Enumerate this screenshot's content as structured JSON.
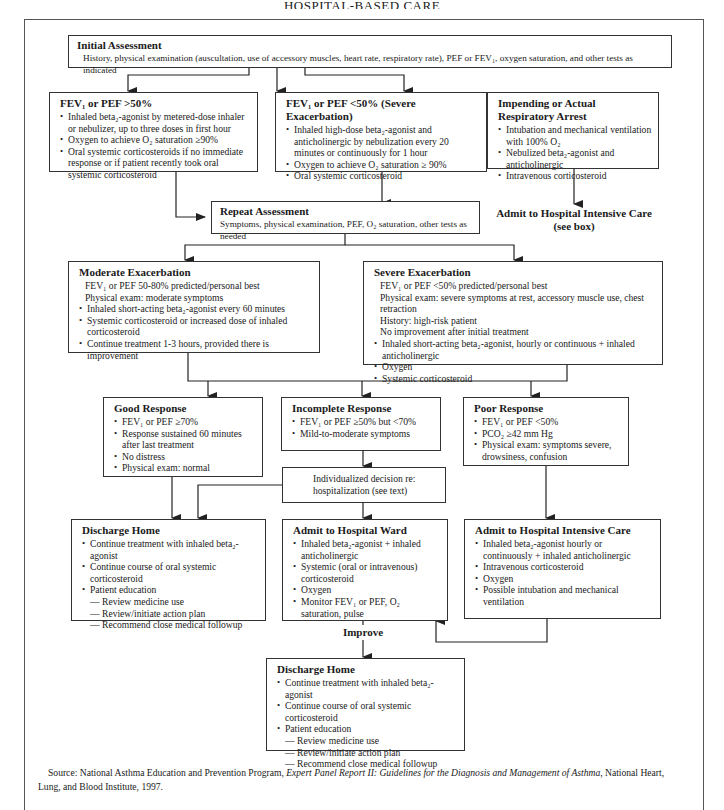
{
  "page": {
    "title": "HOSPITAL-BASED CARE"
  },
  "initial_assessment": {
    "title": "Initial Assessment",
    "text": "History, physical examination (auscultation, use of accessory muscles, heart rate, respiratory rate), PEF or FEV₁, oxygen saturation, and other tests as indicated"
  },
  "fev_above_50": {
    "title": "FEV₁ or PEF >50%",
    "items": [
      "Inhaled beta₂-agonist by metered-dose inhaler or nebulizer, up to three doses in first hour",
      "Oxygen to achieve O₂ saturation ≥90%",
      "Oral systemic corticosteroids if no immediate response or if patient recently took oral systemic corticosteroid"
    ]
  },
  "fev_below_50": {
    "title": "FEV₁ or PEF <50% (Severe Exacerbation)",
    "items": [
      "Inhaled high-dose beta₂-agonist and anticholinergic by nebulization every 20 minutes or continuously for 1 hour",
      "Oxygen to achieve O₂ saturation ≥ 90%",
      "Oral systemic corticosteroid"
    ]
  },
  "respiratory_arrest": {
    "title": "Impending or Actual Respiratory Arrest",
    "items": [
      "Intubation and mechanical ventilation with 100% O₂",
      "Nebulized beta₂-agonist and anticholinergic",
      "Intravenous corticosteroid"
    ]
  },
  "admit_icu_label": {
    "line1": "Admit to Hospital Intensive Care",
    "line2": "(see box)"
  },
  "repeat_assessment": {
    "title": "Repeat Assessment",
    "text": "Symptoms, physical examination, PEF, O₂ saturation, other tests as needed"
  },
  "moderate_exacerbation": {
    "title": "Moderate Exacerbation",
    "lines": [
      "FEV₁ or PEF 50-80% predicted/personal best",
      "Physical exam:  moderate symptoms"
    ],
    "items": [
      "Inhaled short-acting beta₂-agonist every 60 minutes",
      "Systemic corticosteroid or increased dose of inhaled corticosteroid",
      "Continue treatment 1-3 hours, provided there is improvement"
    ]
  },
  "severe_exacerbation": {
    "title": "Severe Exacerbation",
    "lines": [
      "FEV₁ or PEF <50% predicted/personal best",
      "Physical exam:  severe symptoms at rest, accessory muscle use, chest retraction",
      "History:  high-risk patient",
      "No improvement after initial treatment"
    ],
    "items": [
      "Inhaled short-acting beta₂-agonist, hourly or continuous + inhaled anticholinergic",
      "Oxygen",
      "Systemic corticosteroid"
    ]
  },
  "good_response": {
    "title": "Good Response",
    "items": [
      "FEV₁ or PEF ≥70%",
      "Response sustained 60 minutes after last treatment",
      "No distress",
      "Physical exam:  normal"
    ]
  },
  "incomplete_response": {
    "title": "Incomplete Response",
    "items": [
      "FEV₁ or PEF ≥50% but <70%",
      "Mild-to-moderate symptoms"
    ]
  },
  "poor_response": {
    "title": "Poor Response",
    "items": [
      "FEV₁ or PEF <50%",
      "PCO₂ ≥42 mm Hg",
      "Physical exam:  symptoms severe, drowsiness, confusion"
    ]
  },
  "individualized_decision": {
    "line1": "Individualized decision re:",
    "line2": "hospitalization (see text)"
  },
  "discharge_home_1": {
    "title": "Discharge Home",
    "items": [
      "Continue treatment with inhaled beta₂-agonist",
      "Continue course of oral systemic corticosteroid",
      "Patient education"
    ],
    "subitems": [
      "— Review medicine use",
      "— Review/initiate action plan",
      "— Recommend close medical followup"
    ]
  },
  "admit_ward": {
    "title": "Admit to Hospital Ward",
    "items": [
      "Inhaled beta₂-agonist + inhaled anticholinergic",
      "Systemic (oral or intravenous) corticosteroid",
      "Oxygen",
      "Monitor FEV₁ or PEF, O₂ saturation, pulse"
    ]
  },
  "admit_icu": {
    "title": "Admit to Hospital Intensive Care",
    "items": [
      "Inhaled beta₂-agonist hourly or continuously + inhaled anticholinergic",
      "Intravenous corticosteroid",
      "Oxygen",
      "Possible intubation and mechanical ventilation"
    ]
  },
  "improve_label": "Improve",
  "discharge_home_2": {
    "title": "Discharge Home",
    "items": [
      "Continue treatment with inhaled beta₂-agonist",
      "Continue course of oral systemic corticosteroid",
      "Patient education"
    ],
    "subitems": [
      "— Review medicine use",
      "— Review/initiate action plan",
      "— Recommend close medical followup"
    ]
  },
  "source": {
    "prefix": "Source: National Asthma Education and Prevention Program, ",
    "title": "Expert Panel Report II: Guidelines for the Diagnosis and Management of Asthma",
    "suffix": ", National Heart, Lung, and Blood Institute, 1997."
  },
  "colors": {
    "line": "#222222",
    "frame": "#555555",
    "background": "#ffffff"
  }
}
